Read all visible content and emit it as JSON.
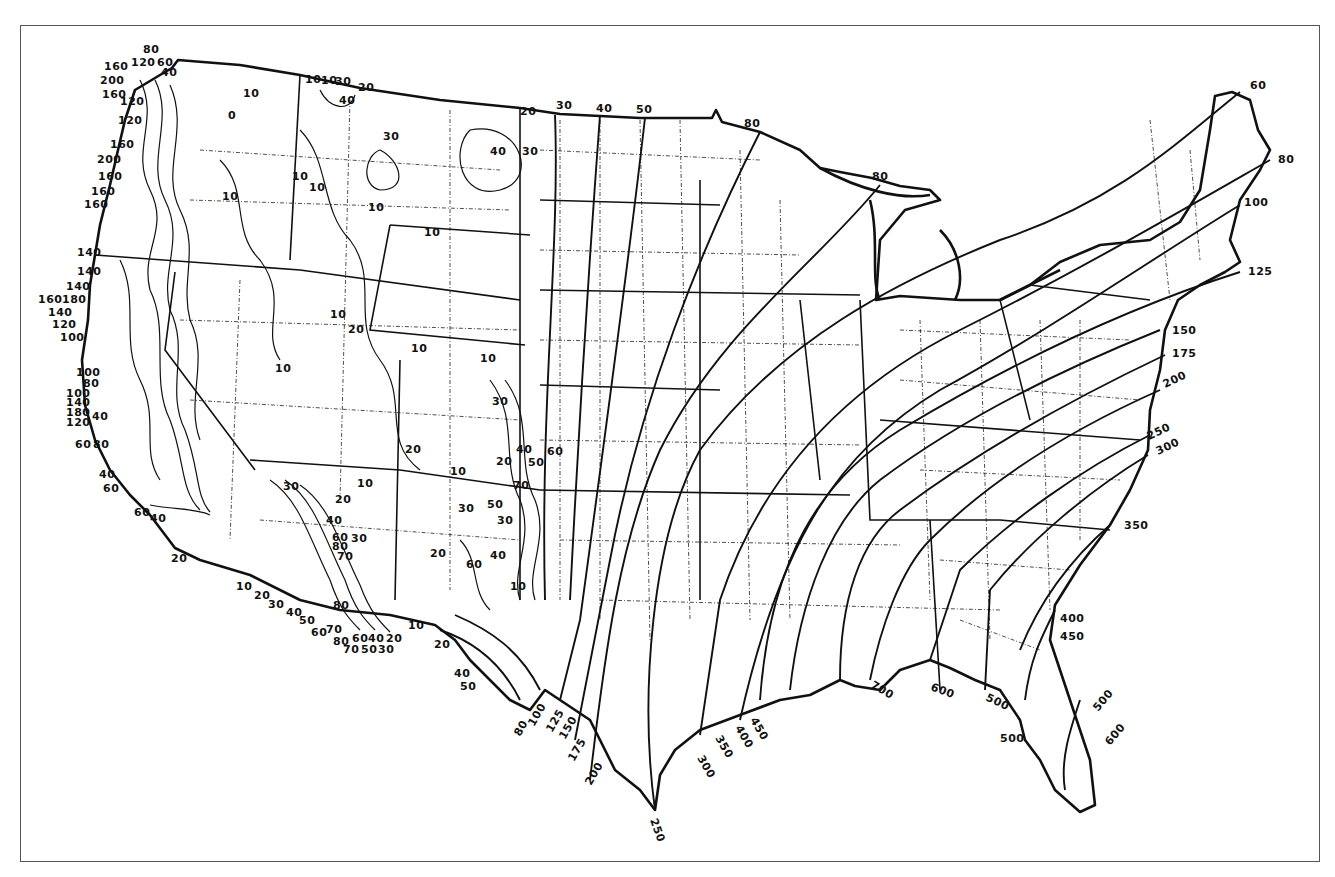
{
  "map": {
    "type": "isoline-map",
    "subject": "Contiguous United States isoline map",
    "colors": {
      "ink": "#111111",
      "paper": "#ffffff",
      "frame": "#555555"
    },
    "labels": [
      {
        "t": "80",
        "x": 143,
        "y": 53
      },
      {
        "t": "160",
        "x": 104,
        "y": 70
      },
      {
        "t": "120",
        "x": 131,
        "y": 66
      },
      {
        "t": "60",
        "x": 157,
        "y": 66
      },
      {
        "t": "40",
        "x": 161,
        "y": 76
      },
      {
        "t": "200",
        "x": 100,
        "y": 84
      },
      {
        "t": "160",
        "x": 102,
        "y": 98
      },
      {
        "t": "120",
        "x": 120,
        "y": 105
      },
      {
        "t": "120",
        "x": 118,
        "y": 124
      },
      {
        "t": "0",
        "x": 228,
        "y": 119
      },
      {
        "t": "10",
        "x": 243,
        "y": 97
      },
      {
        "t": "160",
        "x": 110,
        "y": 148
      },
      {
        "t": "200",
        "x": 97,
        "y": 163
      },
      {
        "t": "160",
        "x": 98,
        "y": 180
      },
      {
        "t": "160",
        "x": 91,
        "y": 195
      },
      {
        "t": "160",
        "x": 84,
        "y": 208
      },
      {
        "t": "10",
        "x": 222,
        "y": 200
      },
      {
        "t": "140",
        "x": 77,
        "y": 256
      },
      {
        "t": "140",
        "x": 77,
        "y": 275
      },
      {
        "t": "140",
        "x": 66,
        "y": 290
      },
      {
        "t": "160",
        "x": 38,
        "y": 303
      },
      {
        "t": "180",
        "x": 62,
        "y": 303
      },
      {
        "t": "140",
        "x": 48,
        "y": 316
      },
      {
        "t": "120",
        "x": 52,
        "y": 328
      },
      {
        "t": "100",
        "x": 60,
        "y": 341
      },
      {
        "t": "100",
        "x": 76,
        "y": 376
      },
      {
        "t": "80",
        "x": 83,
        "y": 387
      },
      {
        "t": "100",
        "x": 66,
        "y": 397
      },
      {
        "t": "140",
        "x": 66,
        "y": 406
      },
      {
        "t": "180",
        "x": 66,
        "y": 416
      },
      {
        "t": "40",
        "x": 92,
        "y": 420
      },
      {
        "t": "120",
        "x": 66,
        "y": 426
      },
      {
        "t": "60",
        "x": 75,
        "y": 448
      },
      {
        "t": "80",
        "x": 93,
        "y": 448
      },
      {
        "t": "40",
        "x": 99,
        "y": 478
      },
      {
        "t": "60",
        "x": 103,
        "y": 492
      },
      {
        "t": "60",
        "x": 134,
        "y": 516
      },
      {
        "t": "40",
        "x": 150,
        "y": 522
      },
      {
        "t": "20",
        "x": 171,
        "y": 562
      },
      {
        "t": "10",
        "x": 305,
        "y": 83
      },
      {
        "t": "10",
        "x": 321,
        "y": 84
      },
      {
        "t": "30",
        "x": 335,
        "y": 85
      },
      {
        "t": "20",
        "x": 358,
        "y": 91
      },
      {
        "t": "40",
        "x": 339,
        "y": 104
      },
      {
        "t": "30",
        "x": 383,
        "y": 140
      },
      {
        "t": "10",
        "x": 292,
        "y": 180
      },
      {
        "t": "10",
        "x": 309,
        "y": 191
      },
      {
        "t": "10",
        "x": 368,
        "y": 211
      },
      {
        "t": "20",
        "x": 520,
        "y": 115
      },
      {
        "t": "30",
        "x": 556,
        "y": 109
      },
      {
        "t": "40",
        "x": 596,
        "y": 112
      },
      {
        "t": "50",
        "x": 636,
        "y": 113
      },
      {
        "t": "40",
        "x": 490,
        "y": 155
      },
      {
        "t": "30",
        "x": 522,
        "y": 155
      },
      {
        "t": "80",
        "x": 744,
        "y": 127
      },
      {
        "t": "10",
        "x": 424,
        "y": 236
      },
      {
        "t": "10",
        "x": 330,
        "y": 318
      },
      {
        "t": "20",
        "x": 348,
        "y": 333
      },
      {
        "t": "10",
        "x": 275,
        "y": 372
      },
      {
        "t": "10",
        "x": 411,
        "y": 352
      },
      {
        "t": "10",
        "x": 480,
        "y": 362
      },
      {
        "t": "30",
        "x": 492,
        "y": 405
      },
      {
        "t": "20",
        "x": 405,
        "y": 453
      },
      {
        "t": "40",
        "x": 516,
        "y": 453
      },
      {
        "t": "60",
        "x": 547,
        "y": 455
      },
      {
        "t": "20",
        "x": 496,
        "y": 465
      },
      {
        "t": "50",
        "x": 528,
        "y": 466
      },
      {
        "t": "10",
        "x": 450,
        "y": 475
      },
      {
        "t": "70",
        "x": 513,
        "y": 489
      },
      {
        "t": "50",
        "x": 487,
        "y": 508
      },
      {
        "t": "30",
        "x": 458,
        "y": 512
      },
      {
        "t": "30",
        "x": 497,
        "y": 524
      },
      {
        "t": "10",
        "x": 357,
        "y": 487
      },
      {
        "t": "30",
        "x": 283,
        "y": 490
      },
      {
        "t": "20",
        "x": 335,
        "y": 503
      },
      {
        "t": "40",
        "x": 326,
        "y": 524
      },
      {
        "t": "30",
        "x": 351,
        "y": 542
      },
      {
        "t": "60",
        "x": 332,
        "y": 541
      },
      {
        "t": "80",
        "x": 332,
        "y": 550
      },
      {
        "t": "70",
        "x": 337,
        "y": 560
      },
      {
        "t": "20",
        "x": 430,
        "y": 557
      },
      {
        "t": "60",
        "x": 466,
        "y": 568
      },
      {
        "t": "40",
        "x": 490,
        "y": 559
      },
      {
        "t": "10",
        "x": 510,
        "y": 590
      },
      {
        "t": "80",
        "x": 333,
        "y": 609
      },
      {
        "t": "10",
        "x": 236,
        "y": 590
      },
      {
        "t": "20",
        "x": 254,
        "y": 599
      },
      {
        "t": "30",
        "x": 268,
        "y": 608
      },
      {
        "t": "40",
        "x": 286,
        "y": 616
      },
      {
        "t": "50",
        "x": 299,
        "y": 624
      },
      {
        "t": "60",
        "x": 311,
        "y": 636
      },
      {
        "t": "70",
        "x": 326,
        "y": 633
      },
      {
        "t": "80",
        "x": 333,
        "y": 645
      },
      {
        "t": "60",
        "x": 352,
        "y": 642
      },
      {
        "t": "40",
        "x": 368,
        "y": 642
      },
      {
        "t": "20",
        "x": 386,
        "y": 642
      },
      {
        "t": "70",
        "x": 343,
        "y": 653
      },
      {
        "t": "50",
        "x": 361,
        "y": 653
      },
      {
        "t": "30",
        "x": 378,
        "y": 653
      },
      {
        "t": "10",
        "x": 408,
        "y": 629
      },
      {
        "t": "20",
        "x": 434,
        "y": 648
      },
      {
        "t": "40",
        "x": 454,
        "y": 677
      },
      {
        "t": "50",
        "x": 460,
        "y": 690
      },
      {
        "t": "80",
        "x": 520,
        "y": 737,
        "r": -60
      },
      {
        "t": "100",
        "x": 534,
        "y": 727,
        "r": -60
      },
      {
        "t": "125",
        "x": 552,
        "y": 733,
        "r": -60
      },
      {
        "t": "150",
        "x": 565,
        "y": 740,
        "r": -60
      },
      {
        "t": "175",
        "x": 574,
        "y": 762,
        "r": -60
      },
      {
        "t": "200",
        "x": 591,
        "y": 786,
        "r": -60
      },
      {
        "t": "250",
        "x": 650,
        "y": 820,
        "r": 70
      },
      {
        "t": "300",
        "x": 697,
        "y": 758,
        "r": 60
      },
      {
        "t": "350",
        "x": 715,
        "y": 738,
        "r": 60
      },
      {
        "t": "400",
        "x": 735,
        "y": 728,
        "r": 60
      },
      {
        "t": "450",
        "x": 750,
        "y": 720,
        "r": 60
      },
      {
        "t": "700",
        "x": 870,
        "y": 687,
        "r": 30
      },
      {
        "t": "600",
        "x": 930,
        "y": 690,
        "r": 20
      },
      {
        "t": "500",
        "x": 985,
        "y": 700,
        "r": 25
      },
      {
        "t": "500",
        "x": 1000,
        "y": 742
      },
      {
        "t": "400",
        "x": 1060,
        "y": 622
      },
      {
        "t": "450",
        "x": 1060,
        "y": 640
      },
      {
        "t": "500",
        "x": 1098,
        "y": 712,
        "r": -50
      },
      {
        "t": "600",
        "x": 1110,
        "y": 746,
        "r": -50
      },
      {
        "t": "350",
        "x": 1124,
        "y": 529
      },
      {
        "t": "300",
        "x": 1158,
        "y": 455,
        "r": -25
      },
      {
        "t": "250",
        "x": 1149,
        "y": 440,
        "r": -25
      },
      {
        "t": "200",
        "x": 1165,
        "y": 388,
        "r": -25
      },
      {
        "t": "175",
        "x": 1172,
        "y": 357
      },
      {
        "t": "150",
        "x": 1172,
        "y": 334
      },
      {
        "t": "125",
        "x": 1248,
        "y": 275
      },
      {
        "t": "100",
        "x": 1244,
        "y": 206
      },
      {
        "t": "80",
        "x": 1278,
        "y": 163
      },
      {
        "t": "60",
        "x": 1250,
        "y": 89
      },
      {
        "t": "80",
        "x": 872,
        "y": 180
      }
    ]
  }
}
